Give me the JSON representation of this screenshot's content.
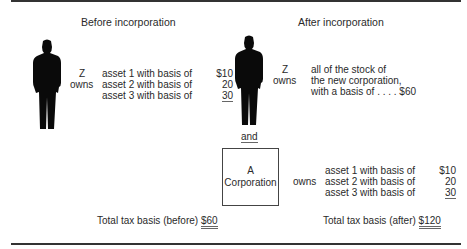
{
  "before": {
    "heading": "Before incorporation",
    "owner": "Z",
    "verb": "owns",
    "assets": [
      {
        "label": "asset 1 with basis of",
        "amount": "$10"
      },
      {
        "label": "asset 2 with basis of",
        "amount": "20"
      },
      {
        "label": "asset 3 with basis of",
        "amount": "30"
      }
    ],
    "total_label": "Total tax basis (before)",
    "total_amount": "$60"
  },
  "after": {
    "heading": "After incorporation",
    "owner": "Z",
    "verb": "owns",
    "stock_lines": [
      "all of the stock of",
      "the new corporation,",
      "with a basis of . . . . $60"
    ],
    "connector": "and",
    "corporation": {
      "line1": "A",
      "line2": "Corporation"
    },
    "corp_verb": "owns",
    "assets": [
      {
        "label": "asset 1 with basis of",
        "amount": "$10"
      },
      {
        "label": "asset 2 with basis of",
        "amount": "20"
      },
      {
        "label": "asset 3 with basis of",
        "amount": "30"
      }
    ],
    "total_label": "Total tax basis (after)",
    "total_amount": "$120"
  },
  "icons": {
    "person_before": "person-silhouette-icon",
    "person_after": "person-silhouette-icon"
  }
}
